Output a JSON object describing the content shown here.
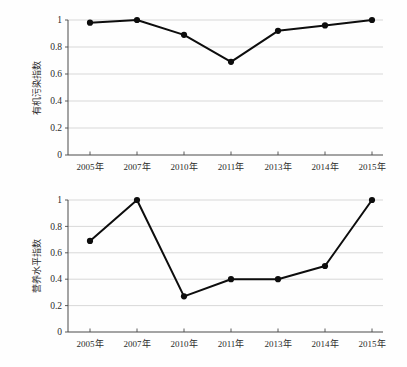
{
  "figure": {
    "background_color": "#fefefe",
    "line_color": "#0d0d0d",
    "grid_color": "#c9c9c9",
    "axis_color": "#4a4a4a"
  },
  "chart_data": [
    {
      "type": "line",
      "title": "",
      "panel": "top",
      "xlabel": "",
      "ylabel": "有机污染指数",
      "categories": [
        "2005年",
        "2007年",
        "2010年",
        "2011年",
        "2013年",
        "2014年",
        "2015年"
      ],
      "values": [
        0.98,
        1.0,
        0.89,
        0.69,
        0.92,
        0.96,
        1.0
      ],
      "ylim": [
        0,
        1
      ],
      "yticks": [
        0,
        0.2,
        0.4,
        0.6,
        0.8,
        1
      ],
      "ytick_labels": [
        "0",
        "0.2",
        "0.4",
        "0.6",
        "0.8",
        "1"
      ],
      "grid": true,
      "legend": false,
      "marker": "circle"
    },
    {
      "type": "line",
      "title": "",
      "panel": "bottom",
      "xlabel": "",
      "ylabel": "营养水平指数",
      "categories": [
        "2005年",
        "2007年",
        "2010年",
        "2011年",
        "2013年",
        "2014年",
        "2015年"
      ],
      "values": [
        0.69,
        1.0,
        0.27,
        0.4,
        0.4,
        0.5,
        1.0
      ],
      "ylim": [
        0,
        1
      ],
      "yticks": [
        0,
        0.2,
        0.4,
        0.6,
        0.8,
        1
      ],
      "ytick_labels": [
        "0",
        "0.2",
        "0.4",
        "0.6",
        "0.8",
        "1"
      ],
      "grid": true,
      "legend": false,
      "marker": "circle"
    }
  ]
}
